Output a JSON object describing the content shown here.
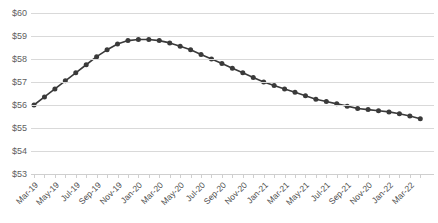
{
  "chart_data": {
    "type": "line",
    "title": "",
    "xlabel": "",
    "ylabel": "",
    "ylim": [
      53,
      60
    ],
    "ytick_values": [
      60,
      59,
      58,
      57,
      56,
      55,
      54,
      53
    ],
    "ytick_labels": [
      "$60",
      "$59",
      "$58",
      "$57",
      "$56",
      "$55",
      "$54",
      "$53"
    ],
    "grid": true,
    "legend": "none",
    "line_color": "#3a3a3a",
    "marker": "circle",
    "marker_color": "#3a3a3a",
    "gridline_color": "#d9d9d9",
    "x_tick_labels": [
      "Mar-19",
      "May-19",
      "Jul-19",
      "Sep-19",
      "Nov-19",
      "Jan-20",
      "Mar-20",
      "May-20",
      "Jul-20",
      "Sep-20",
      "Nov-20",
      "Jan-21",
      "Mar-21",
      "May-21",
      "Jul-21",
      "Sep-21",
      "Nov-20",
      "Jan-22",
      "Mar-22"
    ],
    "x_tick_label_interval_months": 2,
    "categories": [
      "Mar-19",
      "Apr-19",
      "May-19",
      "Jun-19",
      "Jul-19",
      "Aug-19",
      "Sep-19",
      "Oct-19",
      "Nov-19",
      "Dec-19",
      "Jan-20",
      "Feb-20",
      "Mar-20",
      "Apr-20",
      "May-20",
      "Jun-20",
      "Jul-20",
      "Aug-20",
      "Sep-20",
      "Oct-20",
      "Nov-20",
      "Dec-20",
      "Jan-21",
      "Feb-21",
      "Mar-21",
      "Apr-21",
      "May-21",
      "Jun-21",
      "Jul-21",
      "Aug-21",
      "Sep-21",
      "Oct-21",
      "Nov-21",
      "Dec-21",
      "Jan-22",
      "Feb-22",
      "Mar-22",
      "Apr-22"
    ],
    "values": [
      56.0,
      56.35,
      56.7,
      57.05,
      57.4,
      57.75,
      58.1,
      58.4,
      58.65,
      58.8,
      58.85,
      58.85,
      58.8,
      58.7,
      58.55,
      58.4,
      58.2,
      58.0,
      57.8,
      57.6,
      57.4,
      57.2,
      57.0,
      56.85,
      56.7,
      56.55,
      56.4,
      56.25,
      56.15,
      56.05,
      55.95,
      55.85,
      55.8,
      55.75,
      55.7,
      55.62,
      55.52,
      55.4
    ]
  }
}
